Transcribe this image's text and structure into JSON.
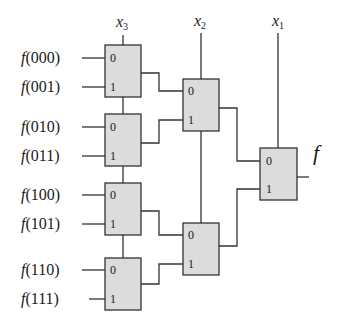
{
  "colors": {
    "box_fill": "#dcdcdc",
    "stroke": "#333333",
    "text": "#1a1a1a"
  },
  "select_labels": {
    "x3": "x",
    "x3_sub": "3",
    "x2": "x",
    "x2_sub": "2",
    "x1": "x",
    "x1_sub": "1"
  },
  "inputs": [
    {
      "fn": "f",
      "arg": "(000)"
    },
    {
      "fn": "f",
      "arg": "(001)"
    },
    {
      "fn": "f",
      "arg": "(010)"
    },
    {
      "fn": "f",
      "arg": "(011)"
    },
    {
      "fn": "f",
      "arg": "(100)"
    },
    {
      "fn": "f",
      "arg": "(101)"
    },
    {
      "fn": "f",
      "arg": "(110)"
    },
    {
      "fn": "f",
      "arg": "(111)"
    }
  ],
  "mux_port_labels": {
    "zero": "0",
    "one": "1"
  },
  "output_label": "f"
}
